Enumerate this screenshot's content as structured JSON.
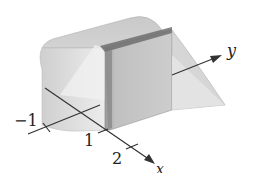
{
  "figure": {
    "axes": {
      "x": {
        "label": "x",
        "ticks": [
          "1",
          "2"
        ]
      },
      "y": {
        "label": "y",
        "ticks": []
      },
      "z": {
        "label": "",
        "ticks": [
          "-1"
        ]
      }
    },
    "tick_labels": {
      "neg_one": "−1",
      "one": "1",
      "two": "2"
    },
    "colors": {
      "solid_light": "#e2e2e2",
      "solid_mid": "#c8c8c8",
      "solid_dark": "#8a8a8a",
      "axis": "#333333"
    }
  }
}
